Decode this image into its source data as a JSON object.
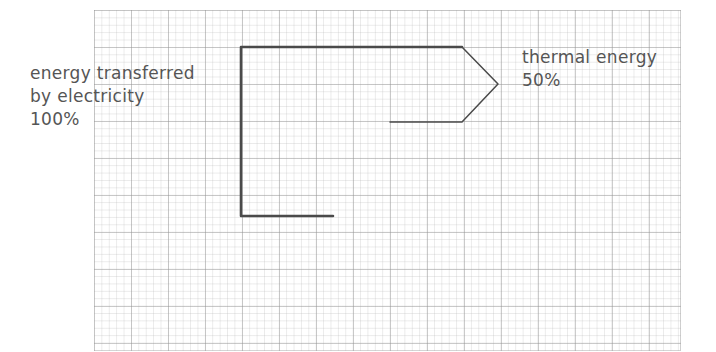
{
  "diagram": {
    "type": "sankey-energy-transfer",
    "input": {
      "line1": "energy transferred",
      "line2": "by electricity",
      "percent": "100%"
    },
    "outputs": [
      {
        "line1": "thermal energy",
        "percent": "50%"
      }
    ],
    "colors": {
      "stroke": "#4a4a4a",
      "text": "#555555",
      "grid": "#bdbdbd"
    }
  }
}
